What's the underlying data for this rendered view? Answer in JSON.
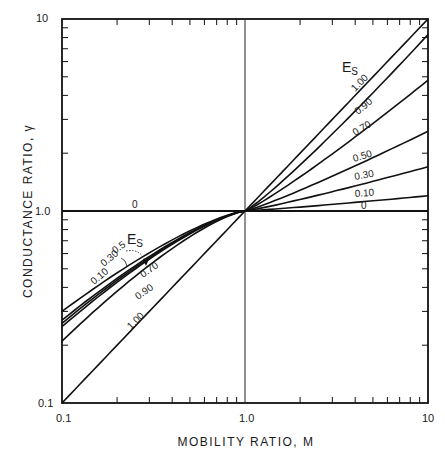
{
  "chart_data": {
    "type": "line",
    "title": "",
    "xlabel": "MOBILITY RATIO, M",
    "ylabel": "CONDUCTANCE RATIO, γ",
    "xscale": "log",
    "yscale": "log",
    "xlim": [
      0.1,
      10
    ],
    "ylim": [
      0.1,
      10
    ],
    "x_ticks": [
      "0.1",
      "1.0",
      "10"
    ],
    "y_ticks": [
      "0.1",
      "1.0",
      "10"
    ],
    "grid": false,
    "reference_lines": {
      "vertical_at_x": 1.0,
      "horizontal_at_y": 1.0
    },
    "legend_title": "E",
    "legend_title_sub": "S",
    "parameter": "Es (sweep efficiency)",
    "x": [
      0.1,
      1.0,
      10
    ],
    "series": [
      {
        "name": "0",
        "values": [
          1.0,
          1.0,
          1.0
        ]
      },
      {
        "name": "0.10",
        "values": [
          0.3,
          1.0,
          1.2
        ]
      },
      {
        "name": "0.30",
        "values": [
          0.27,
          1.0,
          1.7
        ]
      },
      {
        "name": "0.5",
        "values": [
          0.26,
          1.0,
          2.6
        ]
      },
      {
        "name": "0.70",
        "values": [
          0.25,
          1.0,
          4.8
        ]
      },
      {
        "name": "0.90",
        "values": [
          0.21,
          1.0,
          8.3
        ]
      },
      {
        "name": "1.00",
        "values": [
          0.1,
          1.0,
          10.0
        ]
      }
    ],
    "right_labels": [
      "1.00",
      "0.90",
      "0.70",
      "0.50",
      "0.30",
      "0.10",
      "0"
    ],
    "left_labels": [
      "0.10",
      "0.30",
      "0.5",
      "0.70",
      "0.90",
      "1.00"
    ]
  },
  "axes": {
    "x_title": "MOBILITY RATIO, M",
    "y_title": "CONDUCTANCE RATIO, γ",
    "x_tick_min": "0.1",
    "x_tick_mid": "1.0",
    "x_tick_max": "10",
    "y_tick_min": "0.1",
    "y_tick_mid": "1.0",
    "y_tick_max": "10"
  },
  "legend": {
    "upper_title": "E",
    "upper_sub": "S",
    "lower_title": "E",
    "lower_sub": "S"
  },
  "labels": {
    "zero_left": "0",
    "right": {
      "l100": "1.00",
      "l090": "0.90",
      "l070": "0.70",
      "l050": "0.50",
      "l030": "0.30",
      "l010": "0.10",
      "l0": "0"
    },
    "left": {
      "l010": "0.10",
      "l030": "0.30",
      "l05": "0.5",
      "l070": "0.70",
      "l090": "0.90",
      "l100": "1.00"
    }
  }
}
